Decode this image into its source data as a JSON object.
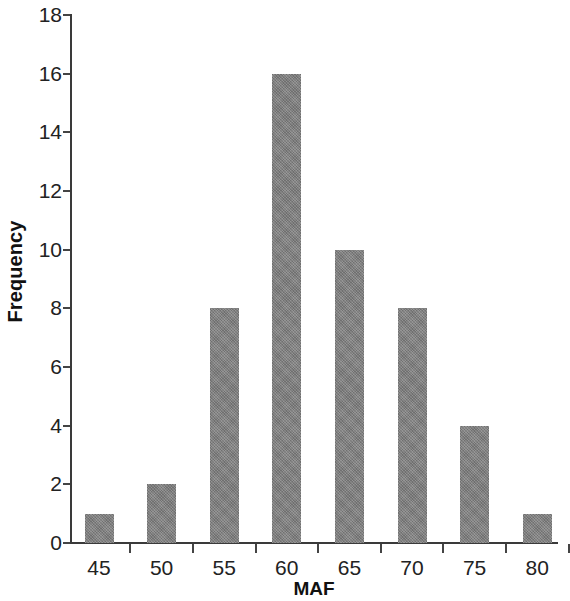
{
  "chart_data": {
    "type": "bar",
    "title": "",
    "subtitle": "",
    "xlabel": "MAF",
    "ylabel": "Frequency",
    "categories": [
      "45",
      "50",
      "55",
      "60",
      "65",
      "70",
      "75",
      "80"
    ],
    "values": [
      1,
      2,
      8,
      16,
      10,
      8,
      4,
      1
    ],
    "series": [
      {
        "name": "Frequency",
        "values": [
          1,
          2,
          8,
          16,
          10,
          8,
          4,
          1
        ]
      }
    ],
    "xlim": [
      42.5,
      82.5
    ],
    "ylim": [
      0,
      18
    ],
    "ytick_labels": [
      "0",
      "2",
      "4",
      "6",
      "8",
      "10",
      "12",
      "14",
      "16",
      "18"
    ],
    "ytick_values": [
      0,
      2,
      4,
      6,
      8,
      10,
      12,
      14,
      16,
      18
    ],
    "xtick_labels": [
      "45",
      "50",
      "55",
      "60",
      "65",
      "70",
      "75",
      "80"
    ],
    "grid": false,
    "legend": false,
    "legend_position": "none",
    "bar_color": "#808080",
    "axis_color": "#3a3a3a",
    "background_color": "#ffffff",
    "annotations": []
  }
}
